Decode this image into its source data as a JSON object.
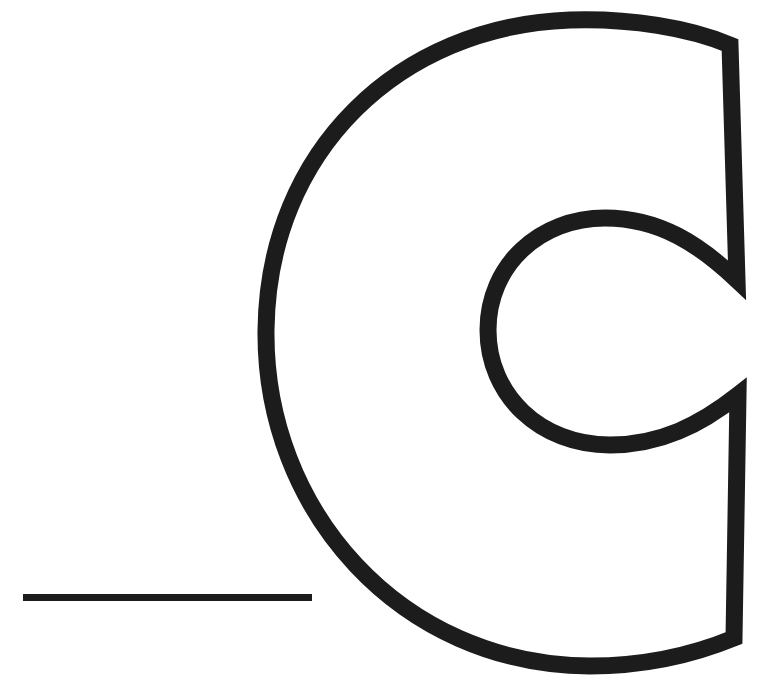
{
  "figure": {
    "glyph": "C",
    "stroke_color": "#1c1c1c",
    "background_color": "#ffffff"
  }
}
